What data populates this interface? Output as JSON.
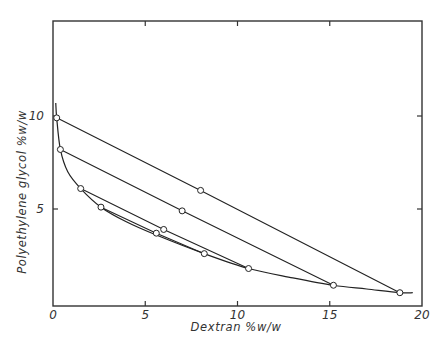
{
  "chart_data": {
    "type": "line",
    "title": "",
    "xlabel": "Dextran %w/w",
    "ylabel": "Polyethylene glycol %w/w",
    "xlim": [
      0,
      20
    ],
    "ylim": [
      0,
      15.2
    ],
    "xticks": [
      0,
      5,
      10,
      15,
      20
    ],
    "xtick_labels": [
      "0",
      "5",
      "10",
      "15",
      "20"
    ],
    "yticks": [
      5,
      10
    ],
    "ytick_labels": [
      "5",
      "10"
    ],
    "grid": false,
    "legend": null,
    "series": [
      {
        "name": "binodal curve",
        "style": "smooth curve",
        "points": [
          [
            0.15,
            10.7
          ],
          [
            0.2,
            9.9
          ],
          [
            0.4,
            8.2
          ],
          [
            0.8,
            7.0
          ],
          [
            1.5,
            6.1
          ],
          [
            2.6,
            5.1
          ],
          [
            4.0,
            4.3
          ],
          [
            5.6,
            3.6
          ],
          [
            8.2,
            2.6
          ],
          [
            10.6,
            1.8
          ],
          [
            13.0,
            1.3
          ],
          [
            15.2,
            0.9
          ],
          [
            17.0,
            0.7
          ],
          [
            18.8,
            0.5
          ],
          [
            19.5,
            0.5
          ]
        ]
      },
      {
        "name": "tie line 1",
        "points": [
          [
            0.2,
            9.9
          ],
          [
            8.0,
            6.0
          ],
          [
            18.8,
            0.5
          ]
        ]
      },
      {
        "name": "tie line 2",
        "points": [
          [
            0.4,
            8.2
          ],
          [
            7.0,
            4.9
          ],
          [
            15.2,
            0.9
          ]
        ]
      },
      {
        "name": "tie line 3",
        "points": [
          [
            1.5,
            6.1
          ],
          [
            6.0,
            3.9
          ],
          [
            10.6,
            1.8
          ]
        ]
      },
      {
        "name": "tie line 4",
        "points": [
          [
            2.6,
            5.1
          ],
          [
            5.6,
            3.7
          ],
          [
            8.2,
            2.6
          ]
        ]
      }
    ],
    "markers": [
      [
        0.2,
        9.9
      ],
      [
        0.4,
        8.2
      ],
      [
        1.5,
        6.1
      ],
      [
        2.6,
        5.1
      ],
      [
        5.6,
        3.7
      ],
      [
        6.0,
        3.9
      ],
      [
        7.0,
        4.9
      ],
      [
        8.0,
        6.0
      ],
      [
        8.2,
        2.6
      ],
      [
        10.6,
        1.8
      ],
      [
        15.2,
        0.9
      ],
      [
        18.8,
        0.5
      ]
    ]
  }
}
